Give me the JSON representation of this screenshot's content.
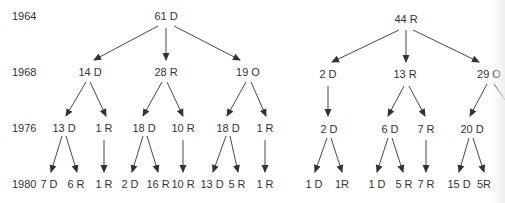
{
  "years": [
    "1964",
    "1968",
    "1976",
    "1980"
  ],
  "trees": [
    {
      "root": "61 D",
      "level_1968": [
        "14 D",
        "28 R",
        "19 O"
      ],
      "level_1976": [
        "13 D",
        "1 R",
        "18 D",
        "10 R",
        "18 D",
        "1 R"
      ],
      "level_1980": [
        "7 D",
        "6 R",
        "1 R",
        "2 D",
        "16 R",
        "10 R",
        "13 D",
        "5 R",
        "1 R"
      ]
    },
    {
      "root": "44 R",
      "level_1968": [
        "2 D",
        "13 R",
        "29 O"
      ],
      "level_1976": [
        "2 D",
        "6 D",
        "7 R",
        "20 D"
      ],
      "level_1980": [
        "1 D",
        "1R",
        "1 D",
        "5 R",
        "7 R",
        "15 D",
        "5R"
      ]
    }
  ],
  "colors": {
    "text": "#333333",
    "arrow": "#333333"
  }
}
